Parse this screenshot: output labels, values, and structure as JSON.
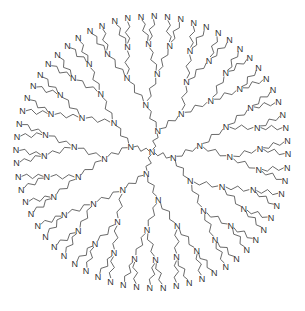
{
  "diagram": {
    "title": "",
    "type": "dendrimer-structure",
    "atom_label": "N",
    "core": {
      "x": 152,
      "y": 152
    },
    "generations": [
      {
        "level": 0,
        "radius": 0,
        "count": 1
      },
      {
        "level": 1,
        "radius": 22,
        "count": 4
      },
      {
        "level": 2,
        "radius": 48,
        "count": 8
      },
      {
        "level": 3,
        "radius": 78,
        "count": 16
      },
      {
        "level": 4,
        "radius": 108,
        "count": 32
      },
      {
        "level": 5,
        "radius": 136,
        "count": 64
      }
    ],
    "start_angle_deg": 60,
    "colors": {
      "line": "#444444",
      "text": "#333333",
      "background": "#ffffff"
    }
  }
}
